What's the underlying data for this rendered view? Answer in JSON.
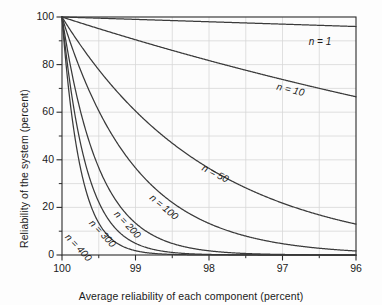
{
  "chart_data": {
    "type": "line",
    "title": "",
    "xlabel": "Average reliability of each component (percent)",
    "ylabel": "Reliability of the system (percent)",
    "xlim": [
      100,
      96
    ],
    "ylim": [
      0,
      100
    ],
    "x_reversed": true,
    "grid": true,
    "legend_position": "inline-labels",
    "x_major_ticks": [
      100,
      99,
      98,
      97,
      96
    ],
    "x_major_tick_labels": [
      "100",
      "99",
      "98",
      "97",
      "96"
    ],
    "x_minor_ticks": [
      99.5,
      98.5,
      97.5,
      96.5
    ],
    "y_major_ticks": [
      0,
      20,
      40,
      60,
      80,
      100
    ],
    "y_major_tick_labels": [
      "0",
      "20",
      "40",
      "60",
      "80",
      "100"
    ],
    "y_minor_ticks": [
      10,
      30,
      50,
      70,
      90
    ],
    "x": [
      100,
      99.75,
      99.5,
      99.25,
      99,
      98.75,
      98.5,
      98.25,
      98,
      97.75,
      97.5,
      97.25,
      97,
      96.75,
      96.5,
      96.25,
      96
    ],
    "series": [
      {
        "name": "n = 1",
        "label": "n = 1",
        "n": 1,
        "values": [
          100,
          99.75,
          99.5,
          99.25,
          99,
          98.75,
          98.5,
          98.25,
          98,
          97.75,
          97.5,
          97.25,
          97,
          96.75,
          96.5,
          96.25,
          96
        ]
      },
      {
        "name": "n = 10",
        "label": "n = 10",
        "n": 10,
        "values": [
          100,
          97.53,
          95.11,
          92.76,
          90.44,
          88.19,
          85.97,
          83.81,
          81.71,
          79.64,
          77.63,
          75.66,
          73.74,
          71.87,
          70.04,
          68.25,
          66.48
        ]
      },
      {
        "name": "n = 50",
        "label": "n = 50",
        "n": 50,
        "values": [
          100,
          88.22,
          77.83,
          68.63,
          60.5,
          53.32,
          46.97,
          41.37,
          36.42,
          32.06,
          28.21,
          24.82,
          21.82,
          19.18,
          16.85,
          14.8,
          12.99
        ]
      },
      {
        "name": "n = 100",
        "label": "n = 100",
        "n": 100,
        "values": [
          100,
          77.82,
          60.58,
          47.1,
          36.6,
          28.43,
          22.06,
          17.11,
          13.26,
          10.28,
          7.96,
          6.16,
          4.76,
          3.68,
          2.84,
          2.19,
          1.69
        ]
      },
      {
        "name": "n = 200",
        "label": "n = 200",
        "n": 200,
        "values": [
          100,
          60.56,
          36.7,
          22.18,
          13.4,
          8.08,
          4.87,
          2.93,
          1.76,
          1.06,
          0.63,
          0.38,
          0.23,
          0.14,
          0.08,
          0.05,
          0.03
        ]
      },
      {
        "name": "n = 300",
        "label": "n = 300",
        "n": 300,
        "values": [
          100,
          47.13,
          22.23,
          10.45,
          4.9,
          2.3,
          1.07,
          0.5,
          0.23,
          0.11,
          0.05,
          0.02,
          0.01,
          0.005,
          0.002,
          0.001,
          0.0005
        ]
      },
      {
        "name": "n = 400",
        "label": "n = 400",
        "n": 400,
        "values": [
          100,
          36.69,
          13.47,
          4.92,
          1.8,
          0.65,
          0.24,
          0.09,
          0.03,
          0.01,
          0.004,
          0.001,
          0.0005,
          0.0002,
          0.0001,
          3e-05,
          1e-05
        ]
      }
    ],
    "annotations": [
      {
        "text": "n = 1",
        "x_px": 320,
        "y_px": 41,
        "rotate": 0
      },
      {
        "text": "n = 10",
        "x_px": 291,
        "y_px": 86,
        "rotate": 14
      },
      {
        "text": "n = 50",
        "x_px": 217,
        "y_px": 167,
        "rotate": 27
      },
      {
        "text": "n = 100",
        "x_px": 168,
        "y_px": 196,
        "rotate": 40
      },
      {
        "text": "n = 200",
        "x_px": 133,
        "y_px": 212,
        "rotate": 47
      },
      {
        "text": "n = 300",
        "x_px": 108,
        "y_px": 221,
        "rotate": 47
      },
      {
        "text": "n = 400",
        "x_px": 84,
        "y_px": 235,
        "rotate": 47
      }
    ]
  },
  "colors": {
    "curve": "#3a3a3a",
    "axis": "#2b2b2b",
    "grid": "#d8d8d8",
    "text": "#1a1a1a",
    "background": "#fdfdfd"
  }
}
